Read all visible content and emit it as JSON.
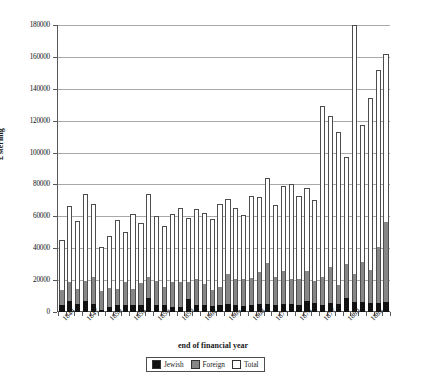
{
  "chart_data": {
    "type": "bar",
    "stacked": true,
    "title": "",
    "xlabel": "end of financial year",
    "ylabel": "£ sterling",
    "ylim": [
      0,
      180000
    ],
    "ytick_step": 20000,
    "ytick_labels": [
      "180000",
      "160000",
      "140000",
      "120000",
      "100000",
      "80000",
      "60000",
      "40000",
      "20000",
      "0"
    ],
    "grid": true,
    "legend_position": "bottom-center",
    "categories": [
      "1844",
      "1845",
      "1846",
      "1847",
      "1848",
      "1849",
      "1850",
      "1851",
      "1852",
      "1853",
      "1854",
      "1855",
      "1856",
      "1857",
      "1858",
      "1859",
      "1860",
      "1861",
      "1862",
      "1863",
      "1864",
      "1865",
      "1866",
      "1867",
      "1868",
      "1869",
      "1870",
      "1871",
      "1872",
      "1873",
      "1874",
      "1875",
      "1876",
      "1877",
      "1878",
      "1879",
      "1880",
      "1881",
      "1882",
      "1883",
      "1884",
      "1885"
    ],
    "xtick_labels": [
      "1844",
      "1847",
      "1850",
      "1853",
      "1856",
      "1859",
      "1862",
      "1865",
      "1868",
      "1871",
      "1874",
      "1877",
      "1880",
      "1883"
    ],
    "xtick_every": 3,
    "series": [
      {
        "name": "Jewish",
        "color": "#111111",
        "values": [
          4200,
          6800,
          4800,
          7000,
          5000,
          1500,
          3200,
          4600,
          4200,
          4400,
          4400,
          8500,
          4600,
          4400,
          3000,
          3200,
          8200,
          4400,
          4200,
          3600,
          4400,
          4800,
          4400,
          3800,
          4600,
          4800,
          5200,
          4200,
          5000,
          5200,
          4600,
          7200,
          5400,
          4600,
          5400,
          5200,
          8800,
          6000,
          6400,
          5800,
          5600,
          6400
        ]
      },
      {
        "name": "Foreign",
        "color": "#878787",
        "values": [
          14000,
          19000,
          14600,
          19200,
          22000,
          13000,
          15200,
          14400,
          18600,
          14600,
          18400,
          22000,
          19600,
          15600,
          18800,
          19000,
          18600,
          20600,
          17400,
          14000,
          16000,
          24000,
          21000,
          20800,
          21400,
          24800,
          30600,
          21800,
          26000,
          21000,
          20600,
          26000,
          19600,
          22000,
          28200,
          17200,
          30400,
          23800,
          31200,
          26400,
          41000,
          56200
        ]
      },
      {
        "name": "Total",
        "color": "#ffffff",
        "values": [
          45000,
          66500,
          57000,
          74000,
          67500,
          41000,
          47500,
          57500,
          50000,
          61500,
          56000,
          74000,
          60000,
          54000,
          61500,
          65000,
          59000,
          64500,
          62000,
          58500,
          68000,
          71000,
          65000,
          61000,
          73000,
          72000,
          84000,
          67000,
          79000,
          80000,
          73000,
          78000,
          70500,
          129000,
          123000,
          113000,
          97000,
          180000,
          117000,
          134000,
          152000,
          162000
        ]
      }
    ]
  },
  "legend": {
    "items": [
      {
        "label": "Jewish"
      },
      {
        "label": "Foreign"
      },
      {
        "label": "Total"
      }
    ]
  },
  "axes": {
    "y_title": "£ sterling",
    "x_title": "end of financial year"
  }
}
